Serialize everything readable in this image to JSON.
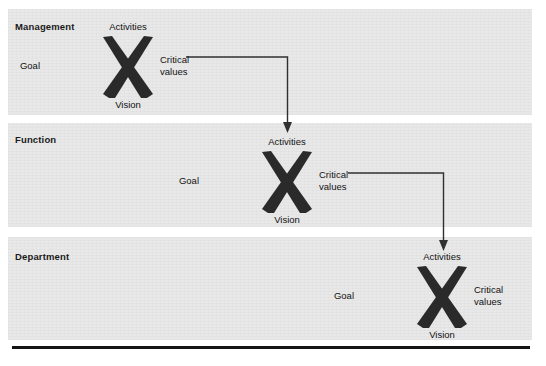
{
  "diagram": {
    "band_fill": "#e8e8e8",
    "ink": "#111111",
    "bands": [
      {
        "id": "management",
        "label": "Management",
        "x_model": {
          "top": "Activities",
          "left": "Goal",
          "right": "Critical\nvalues",
          "right_line1": "Critical",
          "right_line2": "values",
          "bottom": "Vision"
        }
      },
      {
        "id": "function",
        "label": "Function",
        "x_model": {
          "top": "Activities",
          "left": "Goal",
          "right": "Critical\nvalues",
          "right_line1": "Critical",
          "right_line2": "values",
          "bottom": "Vision"
        }
      },
      {
        "id": "department",
        "label": "Department",
        "x_model": {
          "top": "Activities",
          "left": "Goal",
          "right": "Critical\nvalues",
          "right_line1": "Critical",
          "right_line2": "values",
          "bottom": "Vision"
        }
      }
    ],
    "connectors": [
      {
        "id": "management-to-function",
        "from": "Critical values",
        "to": "Activities",
        "shape": "right-then-down-arrow"
      },
      {
        "id": "function-to-department",
        "from": "Critical values",
        "to": "Activities",
        "shape": "right-then-down-arrow"
      }
    ],
    "bottom_rule": ""
  }
}
